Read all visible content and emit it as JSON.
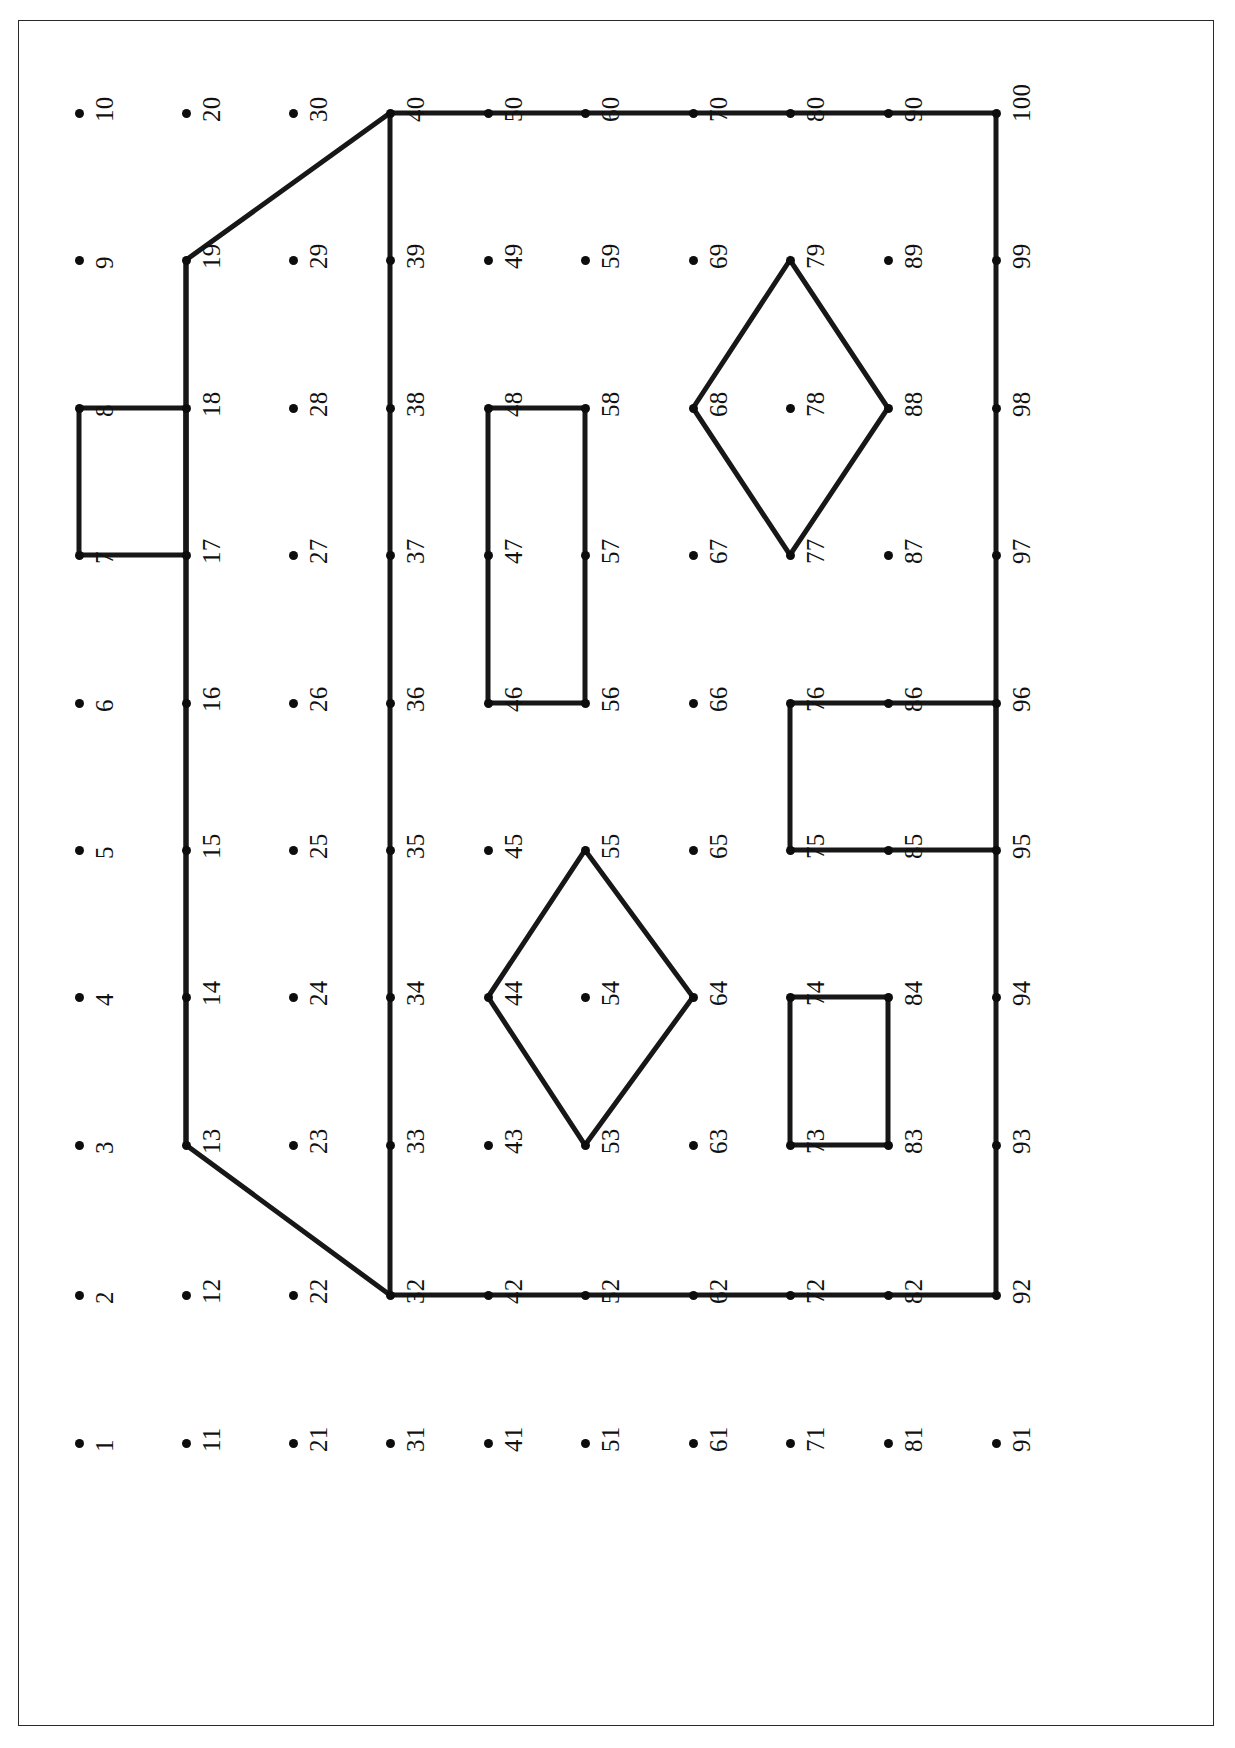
{
  "figure": {
    "title": "",
    "type": "node-mesh-diagram",
    "frame": {
      "x": 18,
      "y": 20,
      "width": 1196,
      "height": 1706,
      "stroke": "#2a2a2a"
    },
    "colors": {
      "node": "#0d0d0d",
      "edge": "#171717",
      "frame": "#2a2a2a",
      "background": "#ffffff",
      "label": "#111111"
    }
  },
  "grid": {
    "columns": 10,
    "rows": 10,
    "column_x": [
      79,
      186,
      293,
      390,
      488,
      585,
      693,
      790,
      888,
      996
    ],
    "row_y": [
      1443,
      1295,
      1145,
      997,
      850,
      703,
      555,
      408,
      260,
      113
    ],
    "numbering": "column-major, bottom-to-top; node n = (col-1)*10 + row"
  },
  "nodes": [
    {
      "id": 1,
      "label": "1",
      "col": 1,
      "row": 1
    },
    {
      "id": 2,
      "label": "2",
      "col": 1,
      "row": 2
    },
    {
      "id": 3,
      "label": "3",
      "col": 1,
      "row": 3
    },
    {
      "id": 4,
      "label": "4",
      "col": 1,
      "row": 4
    },
    {
      "id": 5,
      "label": "5",
      "col": 1,
      "row": 5
    },
    {
      "id": 6,
      "label": "6",
      "col": 1,
      "row": 6
    },
    {
      "id": 7,
      "label": "7",
      "col": 1,
      "row": 7
    },
    {
      "id": 8,
      "label": "8",
      "col": 1,
      "row": 8
    },
    {
      "id": 9,
      "label": "9",
      "col": 1,
      "row": 9
    },
    {
      "id": 10,
      "label": "10",
      "col": 1,
      "row": 10
    },
    {
      "id": 11,
      "label": "11",
      "col": 2,
      "row": 1
    },
    {
      "id": 12,
      "label": "12",
      "col": 2,
      "row": 2
    },
    {
      "id": 13,
      "label": "13",
      "col": 2,
      "row": 3
    },
    {
      "id": 14,
      "label": "14",
      "col": 2,
      "row": 4
    },
    {
      "id": 15,
      "label": "15",
      "col": 2,
      "row": 5
    },
    {
      "id": 16,
      "label": "16",
      "col": 2,
      "row": 6
    },
    {
      "id": 17,
      "label": "17",
      "col": 2,
      "row": 7
    },
    {
      "id": 18,
      "label": "18",
      "col": 2,
      "row": 8
    },
    {
      "id": 19,
      "label": "19",
      "col": 2,
      "row": 9
    },
    {
      "id": 20,
      "label": "20",
      "col": 2,
      "row": 10
    },
    {
      "id": 21,
      "label": "21",
      "col": 3,
      "row": 1
    },
    {
      "id": 22,
      "label": "22",
      "col": 3,
      "row": 2
    },
    {
      "id": 23,
      "label": "23",
      "col": 3,
      "row": 3
    },
    {
      "id": 24,
      "label": "24",
      "col": 3,
      "row": 4
    },
    {
      "id": 25,
      "label": "25",
      "col": 3,
      "row": 5
    },
    {
      "id": 26,
      "label": "26",
      "col": 3,
      "row": 6
    },
    {
      "id": 27,
      "label": "27",
      "col": 3,
      "row": 7
    },
    {
      "id": 28,
      "label": "28",
      "col": 3,
      "row": 8
    },
    {
      "id": 29,
      "label": "29",
      "col": 3,
      "row": 9
    },
    {
      "id": 30,
      "label": "30",
      "col": 3,
      "row": 10
    },
    {
      "id": 31,
      "label": "31",
      "col": 4,
      "row": 1
    },
    {
      "id": 32,
      "label": "32",
      "col": 4,
      "row": 2
    },
    {
      "id": 33,
      "label": "33",
      "col": 4,
      "row": 3
    },
    {
      "id": 34,
      "label": "34",
      "col": 4,
      "row": 4
    },
    {
      "id": 35,
      "label": "35",
      "col": 4,
      "row": 5
    },
    {
      "id": 36,
      "label": "36",
      "col": 4,
      "row": 6
    },
    {
      "id": 37,
      "label": "37",
      "col": 4,
      "row": 7
    },
    {
      "id": 38,
      "label": "38",
      "col": 4,
      "row": 8
    },
    {
      "id": 39,
      "label": "39",
      "col": 4,
      "row": 9
    },
    {
      "id": 40,
      "label": "40",
      "col": 4,
      "row": 10
    },
    {
      "id": 41,
      "label": "41",
      "col": 5,
      "row": 1
    },
    {
      "id": 42,
      "label": "42",
      "col": 5,
      "row": 2
    },
    {
      "id": 43,
      "label": "43",
      "col": 5,
      "row": 3
    },
    {
      "id": 44,
      "label": "44",
      "col": 5,
      "row": 4
    },
    {
      "id": 45,
      "label": "45",
      "col": 5,
      "row": 5
    },
    {
      "id": 46,
      "label": "46",
      "col": 5,
      "row": 6
    },
    {
      "id": 47,
      "label": "47",
      "col": 5,
      "row": 7
    },
    {
      "id": 48,
      "label": "48",
      "col": 5,
      "row": 8
    },
    {
      "id": 49,
      "label": "49",
      "col": 5,
      "row": 9
    },
    {
      "id": 50,
      "label": "50",
      "col": 5,
      "row": 10
    },
    {
      "id": 51,
      "label": "51",
      "col": 6,
      "row": 1
    },
    {
      "id": 52,
      "label": "52",
      "col": 6,
      "row": 2
    },
    {
      "id": 53,
      "label": "53",
      "col": 6,
      "row": 3
    },
    {
      "id": 54,
      "label": "54",
      "col": 6,
      "row": 4
    },
    {
      "id": 55,
      "label": "55",
      "col": 6,
      "row": 5
    },
    {
      "id": 56,
      "label": "56",
      "col": 6,
      "row": 6
    },
    {
      "id": 57,
      "label": "57",
      "col": 6,
      "row": 7
    },
    {
      "id": 58,
      "label": "58",
      "col": 6,
      "row": 8
    },
    {
      "id": 59,
      "label": "59",
      "col": 6,
      "row": 9
    },
    {
      "id": 60,
      "label": "60",
      "col": 6,
      "row": 10
    },
    {
      "id": 61,
      "label": "61",
      "col": 7,
      "row": 1
    },
    {
      "id": 62,
      "label": "62",
      "col": 7,
      "row": 2
    },
    {
      "id": 63,
      "label": "63",
      "col": 7,
      "row": 3
    },
    {
      "id": 64,
      "label": "64",
      "col": 7,
      "row": 4
    },
    {
      "id": 65,
      "label": "65",
      "col": 7,
      "row": 5
    },
    {
      "id": 66,
      "label": "66",
      "col": 7,
      "row": 6
    },
    {
      "id": 67,
      "label": "67",
      "col": 7,
      "row": 7
    },
    {
      "id": 68,
      "label": "68",
      "col": 7,
      "row": 8
    },
    {
      "id": 69,
      "label": "69",
      "col": 7,
      "row": 9
    },
    {
      "id": 70,
      "label": "70",
      "col": 7,
      "row": 10
    },
    {
      "id": 71,
      "label": "71",
      "col": 8,
      "row": 1
    },
    {
      "id": 72,
      "label": "72",
      "col": 8,
      "row": 2
    },
    {
      "id": 73,
      "label": "73",
      "col": 8,
      "row": 3
    },
    {
      "id": 74,
      "label": "74",
      "col": 8,
      "row": 4
    },
    {
      "id": 75,
      "label": "75",
      "col": 8,
      "row": 5
    },
    {
      "id": 76,
      "label": "76",
      "col": 8,
      "row": 6
    },
    {
      "id": 77,
      "label": "77",
      "col": 8,
      "row": 7
    },
    {
      "id": 78,
      "label": "78",
      "col": 8,
      "row": 8
    },
    {
      "id": 79,
      "label": "79",
      "col": 8,
      "row": 9
    },
    {
      "id": 80,
      "label": "80",
      "col": 8,
      "row": 10
    },
    {
      "id": 81,
      "label": "81",
      "col": 9,
      "row": 1
    },
    {
      "id": 82,
      "label": "82",
      "col": 9,
      "row": 2
    },
    {
      "id": 83,
      "label": "83",
      "col": 9,
      "row": 3
    },
    {
      "id": 84,
      "label": "84",
      "col": 9,
      "row": 4
    },
    {
      "id": 85,
      "label": "85",
      "col": 9,
      "row": 5
    },
    {
      "id": 86,
      "label": "86",
      "col": 9,
      "row": 6
    },
    {
      "id": 87,
      "label": "87",
      "col": 9,
      "row": 7
    },
    {
      "id": 88,
      "label": "88",
      "col": 9,
      "row": 8
    },
    {
      "id": 89,
      "label": "89",
      "col": 9,
      "row": 9
    },
    {
      "id": 90,
      "label": "90",
      "col": 9,
      "row": 10
    },
    {
      "id": 91,
      "label": "91",
      "col": 10,
      "row": 1
    },
    {
      "id": 92,
      "label": "92",
      "col": 10,
      "row": 2
    },
    {
      "id": 93,
      "label": "93",
      "col": 10,
      "row": 3
    },
    {
      "id": 94,
      "label": "94",
      "col": 10,
      "row": 4
    },
    {
      "id": 95,
      "label": "95",
      "col": 10,
      "row": 5
    },
    {
      "id": 96,
      "label": "96",
      "col": 10,
      "row": 6
    },
    {
      "id": 97,
      "label": "97",
      "col": 10,
      "row": 7
    },
    {
      "id": 98,
      "label": "98",
      "col": 10,
      "row": 8
    },
    {
      "id": 99,
      "label": "99",
      "col": 10,
      "row": 9
    },
    {
      "id": 100,
      "label": "100",
      "col": 10,
      "row": 10
    }
  ],
  "polylines": [
    {
      "name": "outer-boundary",
      "closed": true,
      "node_path": [
        32,
        13,
        19,
        40,
        100,
        92
      ]
    },
    {
      "name": "inner-boundary-vertical-col4",
      "closed": false,
      "node_path": [
        32,
        40
      ]
    },
    {
      "name": "inner-boundary-vertical-col2",
      "closed": false,
      "node_path": [
        13,
        19
      ]
    },
    {
      "name": "left-notch-rectangle",
      "closed": true,
      "node_path": [
        7,
        8,
        18,
        17
      ]
    },
    {
      "name": "center-tall-rectangle",
      "closed": true,
      "node_path": [
        46,
        48,
        58,
        56
      ]
    },
    {
      "name": "lower-center-diamond",
      "closed": true,
      "node_path": [
        44,
        55,
        64,
        53
      ]
    },
    {
      "name": "upper-right-diamond",
      "closed": true,
      "node_path": [
        68,
        79,
        88,
        77
      ]
    },
    {
      "name": "right-upper-rectangle",
      "closed": true,
      "node_path": [
        75,
        76,
        96,
        95
      ]
    },
    {
      "name": "right-lower-rectangle",
      "closed": true,
      "node_path": [
        73,
        74,
        84,
        83
      ]
    }
  ],
  "solid_nodes": [
    13,
    14,
    15,
    16,
    17,
    18,
    19,
    7,
    8,
    32,
    33,
    34,
    35,
    36,
    37,
    38,
    39,
    40,
    42,
    44,
    46,
    47,
    48,
    50,
    52,
    53,
    55,
    56,
    57,
    58,
    60,
    62,
    64,
    68,
    70,
    72,
    73,
    74,
    75,
    76,
    77,
    79,
    80,
    82,
    83,
    84,
    85,
    86,
    88,
    90,
    92,
    93,
    94,
    95,
    96,
    97,
    98,
    99,
    100
  ]
}
